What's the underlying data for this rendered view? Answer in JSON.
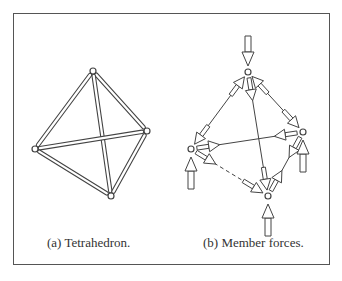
{
  "figure": {
    "panels": [
      {
        "id": "a",
        "caption": "(a)  Tetrahedron.",
        "nodes": [
          "top",
          "right",
          "left",
          "bottom"
        ],
        "members": [
          [
            "top",
            "left"
          ],
          [
            "top",
            "right"
          ],
          [
            "top",
            "bottom"
          ],
          [
            "left",
            "right"
          ],
          [
            "left",
            "bottom"
          ],
          [
            "right",
            "bottom"
          ]
        ]
      },
      {
        "id": "b",
        "caption": "(b)  Member forces.",
        "nodes": [
          "top",
          "right",
          "left",
          "bottom"
        ],
        "external_loads": [
          {
            "node": "top",
            "direction": "down"
          },
          {
            "node": "left",
            "direction": "up"
          },
          {
            "node": "right",
            "direction": "up"
          },
          {
            "node": "bottom",
            "direction": "up"
          }
        ]
      }
    ]
  }
}
